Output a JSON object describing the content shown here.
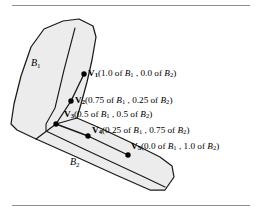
{
  "figure": {
    "type": "diagram",
    "fill_color": "#ececec",
    "outline_color": "#1a1a1a",
    "rule_color": "#8e8e8e",
    "background_color": "#ffffff"
  },
  "rules": {
    "top": "",
    "bottom": ""
  },
  "regions": [
    {
      "id": "B1",
      "name": "B",
      "subscript": "1",
      "x": 31,
      "y": 62
    },
    {
      "id": "B2",
      "name": "B",
      "subscript": "2",
      "x": 70,
      "y": 160
    }
  ],
  "vertices": [
    {
      "id": "V1",
      "symbol": "V",
      "subscript": "1",
      "text": "(1.0 of B1 , 0.0 of B2)",
      "parts": {
        "open": "(",
        "val1": "1.0 of ",
        "b1": "B",
        "b1sub": "1",
        "comma": " , ",
        "val2": "0.0 of ",
        "b2": "B",
        "b2sub": "2",
        "close": ")"
      },
      "dot": {
        "x": 84,
        "y": 74
      },
      "label": {
        "x": 88,
        "y": 69
      }
    },
    {
      "id": "V2",
      "symbol": "V",
      "subscript": "2",
      "text": "(0.75 of B1 , 0.25 of B2)",
      "parts": {
        "open": "(",
        "val1": "0.75 of ",
        "b1": "B",
        "b1sub": "1",
        "comma": " , ",
        "val2": "0.25 of ",
        "b2": "B",
        "b2sub": "2",
        "close": ")"
      },
      "dot": {
        "x": 71,
        "y": 101
      },
      "label": {
        "x": 75,
        "y": 96
      }
    },
    {
      "id": "V3",
      "symbol": "V",
      "subscript": "3",
      "text": "(0.5 of B1 , 0.5 of B2)",
      "parts": {
        "open": "(",
        "val1": "0.5 of ",
        "b1": "B",
        "b1sub": "1",
        "comma": " , ",
        "val2": "0.5 of ",
        "b2": "B",
        "b2sub": "2",
        "close": ")"
      },
      "dot": {
        "x": 56,
        "y": 124
      },
      "label": {
        "x": 66,
        "y": 110
      }
    },
    {
      "id": "V4",
      "symbol": "V",
      "subscript": "4",
      "text": "(0.25 of B1 , 0.75 of B2)",
      "parts": {
        "open": "(",
        "val1": "0.25 of ",
        "b1": "B",
        "b1sub": "1",
        "comma": " , ",
        "val2": "0.75 of ",
        "b2": "B",
        "b2sub": "2",
        "close": ")"
      },
      "dot": {
        "x": 88,
        "y": 136
      },
      "label": {
        "x": 92,
        "y": 126
      }
    },
    {
      "id": "V5",
      "symbol": "V",
      "subscript": "5",
      "text": "(0.0 of B1 , 1.0 of B2)",
      "parts": {
        "open": "(",
        "val1": "0.0 of ",
        "b1": "B",
        "b1sub": "1",
        "comma": " , ",
        "val2": "1.0 of ",
        "b2": "B",
        "b2sub": "2",
        "close": ")"
      },
      "dot": {
        "x": 128,
        "y": 155
      },
      "label": {
        "x": 132,
        "y": 142
      }
    }
  ],
  "geometry": {
    "outer_path": "M 62,21 L 78,19 L 92,25 L 96,36 L 92,60 L 88,80 L 84,100 L 78,118 L 96,126 L 128,141 L 156,154 L 170,162 L 174,175 L 166,189 L 150,190 L 118,176 L 76,157 L 38,140 L 18,130 L 12,124 L 15,104 L 21,76 L 30,48 L 42,30 Z",
    "inner_path": "M 74,28 L 62,68 L 52,110 L 44,126 L 44,132 L 82,149 L 140,175 L 163,185",
    "chain_path": "M 84,74 L 71,101 L 56,124 L 88,136 L 128,155",
    "notch_path": "M 78,118 L 56,124 L 38,140"
  }
}
